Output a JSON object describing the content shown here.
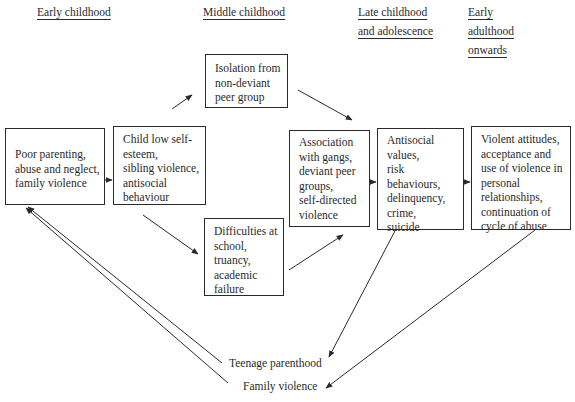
{
  "stages": [
    {
      "id": "early-childhood",
      "lines": [
        "Early childhood"
      ]
    },
    {
      "id": "middle-childhood",
      "lines": [
        "Middle childhood"
      ]
    },
    {
      "id": "late-childhood",
      "lines": [
        "Late childhood",
        "and adolescence"
      ]
    },
    {
      "id": "early-adulthood",
      "lines": [
        "Early",
        "adulthood",
        "onwards"
      ]
    }
  ],
  "boxes": [
    {
      "id": "poor-parenting",
      "lines": [
        "Poor parenting,",
        "abuse and neglect,",
        "family violence"
      ]
    },
    {
      "id": "child-low-self-esteem",
      "lines": [
        "Child low self-",
        "esteem,",
        "sibling violence,",
        "antisocial",
        "behaviour"
      ]
    },
    {
      "id": "isolation",
      "lines": [
        "Isolation from",
        "non-deviant",
        "peer group"
      ]
    },
    {
      "id": "difficulties-at-school",
      "lines": [
        "Difficulties at",
        "school,",
        "truancy,",
        "academic",
        "failure"
      ]
    },
    {
      "id": "association-with-gangs",
      "lines": [
        "Association",
        "with gangs,",
        "deviant peer",
        "groups,",
        "self-directed",
        "violence"
      ]
    },
    {
      "id": "antisocial-values",
      "lines": [
        "Antisocial",
        "values,",
        "risk",
        "behaviours,",
        "delinquency,",
        "crime,",
        "suicide"
      ]
    },
    {
      "id": "violent-attitudes",
      "lines": [
        "Violent attitudes,",
        "acceptance and",
        "use of violence in",
        "personal",
        "relationships,",
        "continuation of",
        "cycle of abuse"
      ]
    }
  ],
  "outcomes": {
    "teenage_parenthood": "Teenage parenthood",
    "family_violence": "Family violence"
  },
  "colors": {
    "line": "#2a2a2a",
    "background": "#ffffff"
  }
}
